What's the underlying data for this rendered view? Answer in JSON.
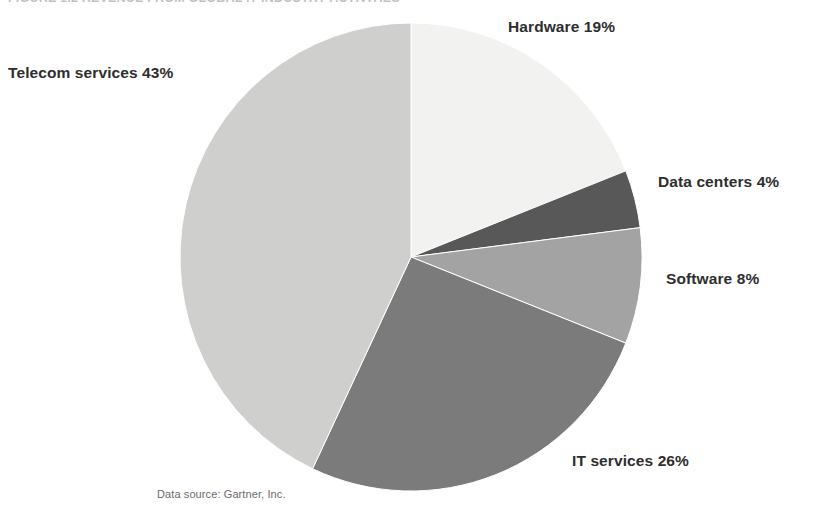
{
  "figure": {
    "title": "FIGURE 1.2 REVENUE FROM GLOBAL IT INDUSTRY ACTIVITIES",
    "source_note": "Data source: Gartner, Inc."
  },
  "ghost_text": {
    "lines": [
      "al business",
      "one technologies",
      "and the devices are",
      "link, it also provides",
      "of, security, the",
      "more of"
    ]
  },
  "labels": {
    "hardware": "Hardware 19%",
    "telecom": "Telecom services 43%",
    "data_centers": "Data centers 4%",
    "software": "Software 8%",
    "it_services": "IT services 26%"
  },
  "chart_data": {
    "type": "pie",
    "title": "FIGURE 1.2 REVENUE FROM GLOBAL IT INDUSTRY ACTIVITIES",
    "categories": [
      "Hardware",
      "Data centers",
      "Software",
      "IT services",
      "Telecom services"
    ],
    "values": [
      19,
      4,
      8,
      26,
      43
    ],
    "unit": "percent",
    "total": 100,
    "start_angle_deg": 0,
    "direction": "clockwise",
    "legend": "none",
    "labels_position": "outside",
    "colors": [
      "#f2f2f0",
      "#585858",
      "#a3a3a3",
      "#7b7b7b",
      "#cfcfcd"
    ],
    "stroke": "#ffffff",
    "slices": [
      {
        "name": "Hardware",
        "value": 19,
        "label": "Hardware 19%",
        "color": "#f2f2f0"
      },
      {
        "name": "Data centers",
        "value": 4,
        "label": "Data centers 4%",
        "color": "#585858"
      },
      {
        "name": "Software",
        "value": 8,
        "label": "Software 8%",
        "color": "#a3a3a3"
      },
      {
        "name": "IT services",
        "value": 26,
        "label": "IT services 26%",
        "color": "#7b7b7b"
      },
      {
        "name": "Telecom services",
        "value": 43,
        "label": "Telecom services 43%",
        "color": "#cfcfcd"
      }
    ],
    "source": "Data source: Gartner, Inc."
  }
}
